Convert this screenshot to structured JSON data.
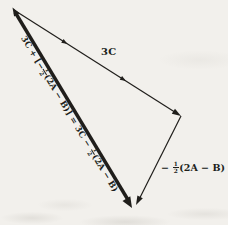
{
  "figure": {
    "background": "#f2f0ec",
    "ink": "#201e1b",
    "labels": {
      "vector_3c": "3C",
      "resultant": {
        "part1": "3C + [−",
        "frac1_num": "1",
        "frac1_den": "2",
        "part2": "(2A − B)] = 3C − ",
        "frac2_num": "1",
        "frac2_den": "2",
        "part3": "(2A − B)"
      },
      "side_vector": {
        "prefix": "− ",
        "frac_num": "1",
        "frac_den": "2",
        "suffix": "(2A − B)"
      }
    }
  }
}
